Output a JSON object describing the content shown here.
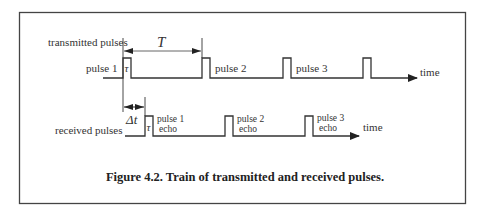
{
  "figure": {
    "caption": "Figure 4.2. Train of transmitted and received pulses.",
    "colors": {
      "stroke": "#333333",
      "frame": "#444444",
      "text": "#333333",
      "background": "#ffffff"
    }
  },
  "transmitted": {
    "row_label": "transmitted pulses",
    "axis_label": "time",
    "period_symbol": "T",
    "width_symbol": "τ",
    "pulses": [
      {
        "label": "pulse 1"
      },
      {
        "label": "pulse 2"
      },
      {
        "label": "pulse 3"
      },
      {
        "label": ""
      }
    ]
  },
  "received": {
    "row_label": "received pulses",
    "axis_label": "time",
    "delay_symbol": "Δt",
    "width_symbol": "τ",
    "echoes": [
      {
        "line1": "pulse 1",
        "line2": "echo"
      },
      {
        "line1": "pulse 2",
        "line2": "echo"
      },
      {
        "line1": "pulse 3",
        "line2": "echo"
      }
    ]
  }
}
